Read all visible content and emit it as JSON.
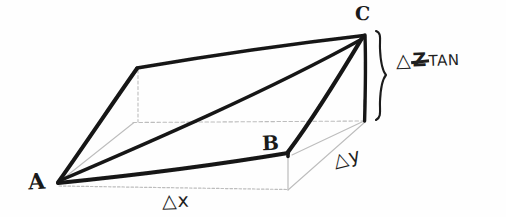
{
  "figure": {
    "kind": "hand-drawn-3d-wedge-diagram",
    "ink_color": "#1a1a1a",
    "faint_ink_color": "#b9b9b9",
    "background_color": "#fefefe"
  },
  "vertices": {
    "a": {
      "label": "A",
      "x": 58,
      "y": 183
    },
    "b": {
      "label": "B",
      "x": 288,
      "y": 153
    },
    "c": {
      "label": "C",
      "x": 364,
      "y": 35
    },
    "d": {
      "label": "",
      "x": 138,
      "y": 68
    }
  },
  "dimensions": {
    "dx": {
      "label": "△x"
    },
    "dy": {
      "label": "△y"
    },
    "dz": {
      "delta": "△",
      "symbol": "Z",
      "subscript": "TAN",
      "full": "△Z̶ TAN"
    }
  },
  "brace": {
    "glyph": "}",
    "top_y": 30,
    "bottom_y": 122
  }
}
